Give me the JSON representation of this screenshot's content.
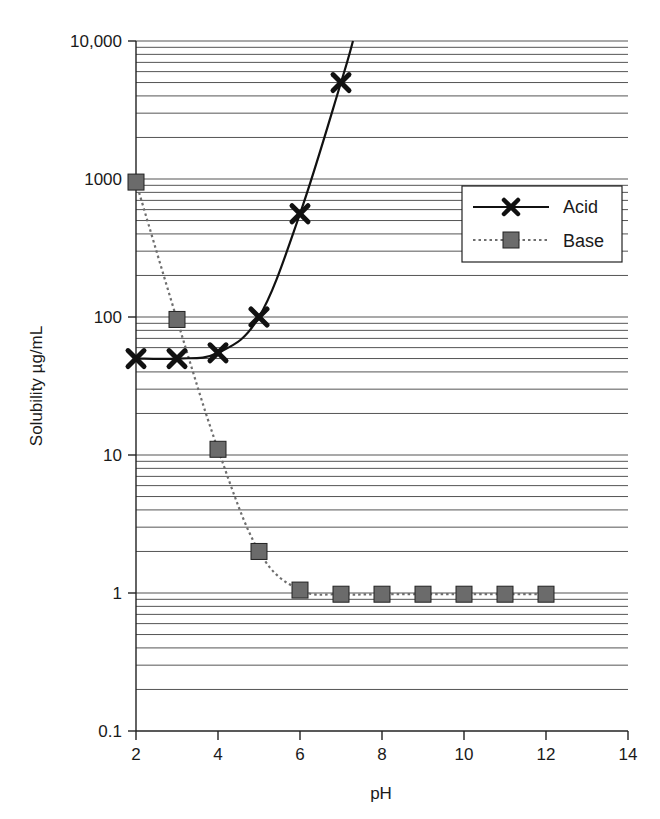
{
  "chart_data": {
    "type": "line",
    "title": "",
    "xlabel": "pH",
    "ylabel": "Solubility µg/mL",
    "xlim": [
      2,
      14
    ],
    "ylim": [
      0.1,
      10000
    ],
    "yscale": "log",
    "x_ticks": [
      "2",
      "4",
      "6",
      "8",
      "10",
      "12",
      "14"
    ],
    "y_ticks": [
      "0.1",
      "1",
      "10",
      "100",
      "1000",
      "10,000"
    ],
    "grid": "horizontal major and minor (log)",
    "legend_position": "upper right",
    "series": [
      {
        "name": "Acid",
        "marker": "x",
        "line_style": "solid",
        "color": "#111111",
        "x": [
          2,
          3,
          4,
          5,
          6,
          7
        ],
        "values": [
          50,
          50,
          55,
          100,
          560,
          5000
        ]
      },
      {
        "name": "Base",
        "marker": "square",
        "line_style": "dotted",
        "color": "#666666",
        "x": [
          2,
          3,
          4,
          5,
          6,
          7,
          8,
          9,
          10,
          11,
          12
        ],
        "values": [
          950,
          96,
          11,
          2,
          1.05,
          0.98,
          0.98,
          0.98,
          0.98,
          0.98,
          0.98
        ]
      }
    ]
  },
  "legend": {
    "items": [
      {
        "label": "Acid"
      },
      {
        "label": "Base"
      }
    ]
  },
  "colors": {
    "acid_line": "#111111",
    "base_line": "#6e6e6e",
    "base_marker_fill": "#6b6b6b",
    "grid": "#555555"
  }
}
